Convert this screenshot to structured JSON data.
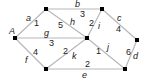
{
  "graph": {
    "nodes": [
      {
        "id": "A",
        "label": "A",
        "x": 15,
        "y": 38
      },
      {
        "id": "n1",
        "label": "",
        "x": 46,
        "y": 9
      },
      {
        "id": "n2",
        "label": "",
        "x": 102,
        "y": 9
      },
      {
        "id": "n3",
        "label": "",
        "x": 87,
        "y": 38
      },
      {
        "id": "n4",
        "label": "",
        "x": 137,
        "y": 40
      },
      {
        "id": "n5",
        "label": "",
        "x": 46,
        "y": 69
      },
      {
        "id": "n6",
        "label": "",
        "x": 125,
        "y": 69
      }
    ],
    "edges": [
      {
        "name": "a",
        "weight": "1",
        "from": "A",
        "to": "n1"
      },
      {
        "name": "g",
        "weight": "3",
        "from": "A",
        "to": "n3"
      },
      {
        "name": "f",
        "weight": "4",
        "from": "A",
        "to": "n5"
      },
      {
        "name": "b",
        "weight": "3",
        "from": "n1",
        "to": "n2"
      },
      {
        "name": "h",
        "weight": "5",
        "from": "n1",
        "to": "n3"
      },
      {
        "name": "i",
        "weight": "2",
        "from": "n2",
        "to": "n3"
      },
      {
        "name": "c",
        "weight": "4",
        "from": "n2",
        "to": "n4"
      },
      {
        "name": "k",
        "weight": "2",
        "from": "n3",
        "to": "n5"
      },
      {
        "name": "j",
        "weight": "1",
        "from": "n3",
        "to": "n6"
      },
      {
        "name": "d",
        "weight": "6",
        "from": "n4",
        "to": "n6"
      },
      {
        "name": "e",
        "weight": "2",
        "from": "n5",
        "to": "n6"
      }
    ]
  },
  "labels": {
    "A": "A",
    "a": "a",
    "a_w": "1",
    "g": "g",
    "g_w": "3",
    "f": "f",
    "f_w": "4",
    "b": "b",
    "b_w": "3",
    "h": "h",
    "h_w": "5",
    "i": "i",
    "i_w": "2",
    "c": "c",
    "c_w": "4",
    "k": "k",
    "k_w": "2",
    "j": "j",
    "j_w": "1",
    "d": "d",
    "d_w": "6",
    "e": "e",
    "e_w": "2"
  }
}
